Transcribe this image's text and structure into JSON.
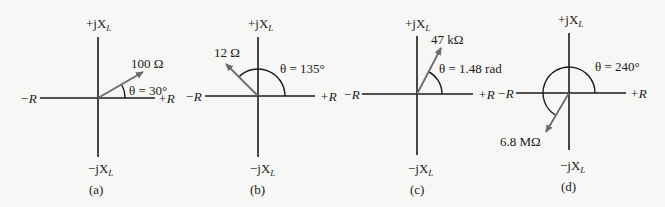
{
  "colors": {
    "axis": "#1a1a1a",
    "phasor": "#6b6b6b",
    "background": "#f7f7f5"
  },
  "axes_labels": {
    "pos_real": "+R",
    "neg_real": "−R",
    "pos_imag_prefix": "+jX",
    "neg_imag_prefix": "−jX",
    "imag_subscript": "L"
  },
  "panels": [
    {
      "id": "a",
      "caption": "(a)",
      "magnitude": "100  Ω",
      "angle_label": "θ = 30°",
      "angle_deg": 30
    },
    {
      "id": "b",
      "caption": "(b)",
      "magnitude": "12  Ω",
      "angle_label": "θ = 135°",
      "angle_deg": 135
    },
    {
      "id": "c",
      "caption": "(c)",
      "magnitude": "47  kΩ",
      "angle_label": "θ = 1.48  rad",
      "angle_deg": 84.8
    },
    {
      "id": "d",
      "caption": "(d)",
      "magnitude": "6.8  MΩ",
      "angle_label": "θ = 240°",
      "angle_deg": 240
    }
  ]
}
